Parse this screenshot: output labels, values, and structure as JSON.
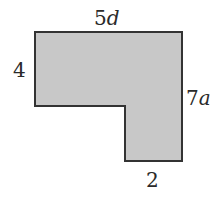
{
  "diagram": {
    "shape": "L-shaped polygon",
    "fill_color": "#c8c8c8",
    "stroke_color": "#333333",
    "points": "35,32 182,32 182,161 125,161 125,106 35,106",
    "labels": {
      "top": {
        "number": "5",
        "variable": "d"
      },
      "left": {
        "number": "4",
        "variable": ""
      },
      "right": {
        "number": "7",
        "variable": "a"
      },
      "bottom": {
        "number": "2",
        "variable": ""
      }
    }
  }
}
